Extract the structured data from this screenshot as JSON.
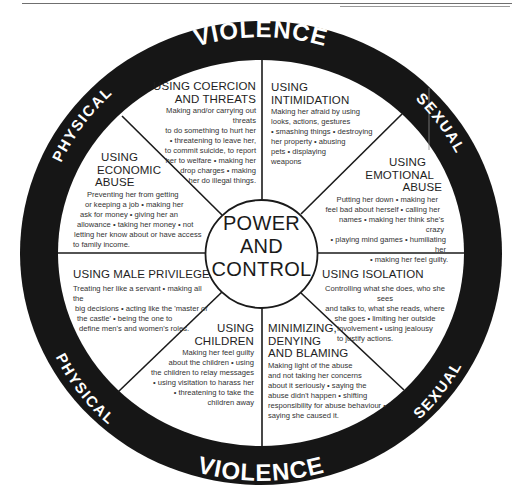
{
  "header": {
    "page_marker": "· · ·"
  },
  "wheel": {
    "center": {
      "line1": "POWER",
      "line2": "AND",
      "line3": "CONTROL"
    },
    "outer_ring": {
      "top": {
        "left_word": "PHYSICAL",
        "middle_word": "VIOLENCE",
        "right_word": "SEXUAL"
      },
      "bottom": {
        "left_word": "PHYSICAL",
        "middle_word": "VIOLENCE",
        "right_word": "SEXUAL"
      }
    },
    "colors": {
      "ring": "#161616",
      "background": "#ffffff",
      "spoke": "#1a1a1a"
    },
    "segments": [
      {
        "id": "coercion-threats",
        "title_lines": [
          "USING COERCION",
          "AND THREATS"
        ],
        "body_lines": [
          "Making and/or carrying out threats",
          "to do something to hurt her",
          "• threatening to leave her,",
          "to commit suicide, to report",
          "her to welfare • making her",
          "drop charges • making",
          "her do illegal things."
        ]
      },
      {
        "id": "intimidation",
        "title_lines": [
          "USING",
          "INTIMIDATION"
        ],
        "body_lines": [
          "Making her afraid by using",
          "looks, actions, gestures",
          "• smashing things • destroying",
          "her property • abusing",
          "pets • displaying",
          "weapons"
        ]
      },
      {
        "id": "emotional-abuse",
        "title_lines": [
          "USING",
          "EMOTIONAL",
          "ABUSE"
        ],
        "body_lines": [
          "Putting her down • making her",
          "feel bad about herself • calling her",
          "names • making her think she's crazy",
          "• playing mind games • humiliating her",
          "• making her feel guilty."
        ]
      },
      {
        "id": "isolation",
        "title_lines": [
          "USING ISOLATION"
        ],
        "body_lines": [
          "Controlling what she does, who she sees",
          "and talks to, what she reads, where",
          "she goes • limiting her outside",
          "involvement • using jealousy",
          "to justify actions."
        ]
      },
      {
        "id": "minimizing-denying-blaming",
        "title_lines": [
          "MINIMIZING,",
          "DENYING",
          "AND BLAMING"
        ],
        "body_lines": [
          "Making light of the abuse",
          "and not taking her concerns",
          "about it seriously • saying the",
          "abuse didn't happen • shifting",
          "responsibility for abuse behaviour •",
          "saying she caused it."
        ]
      },
      {
        "id": "children",
        "title_lines": [
          "USING",
          "CHILDREN"
        ],
        "body_lines": [
          "Making her feel guilty",
          "about the children • using",
          "the children to relay messages",
          "• using visitation to harass her",
          "• threatening to take the",
          "children away"
        ]
      },
      {
        "id": "male-privilege",
        "title_lines": [
          "USING MALE PRIVILEGE"
        ],
        "body_lines": [
          "Treating her like a servant • making all the",
          "big decisions • acting like the 'master of",
          "the castle' • being the one to",
          "define men's and women's roles."
        ]
      },
      {
        "id": "economic-abuse",
        "title_lines": [
          "USING",
          "ECONOMIC",
          "ABUSE"
        ],
        "body_lines": [
          "Preventing her from getting",
          "or keeping a job • making her",
          "ask for money • giving her an",
          "allowance • taking her money • not",
          "letting her know about or have access",
          "to family income."
        ]
      }
    ]
  }
}
